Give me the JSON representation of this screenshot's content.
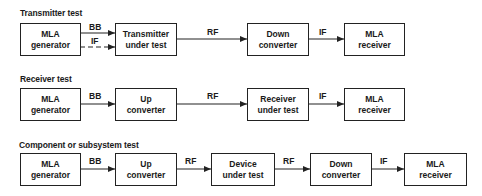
{
  "rows": [
    {
      "title": "Transmitter test",
      "blocks": [
        {
          "line1": "MLA",
          "line2": "generator"
        },
        {
          "line1": "Transmitter",
          "line2": "under test"
        },
        {
          "line1": "Down",
          "line2": "converter"
        },
        {
          "line1": "MLA",
          "line2": "receiver"
        }
      ],
      "signals": [
        "BB",
        "IF",
        "RF",
        "IF"
      ]
    },
    {
      "title": "Receiver test",
      "blocks": [
        {
          "line1": "MLA",
          "line2": "generator"
        },
        {
          "line1": "Up",
          "line2": "converter"
        },
        {
          "line1": "Receiver",
          "line2": "under test"
        },
        {
          "line1": "MLA",
          "line2": "receiver"
        }
      ],
      "signals": [
        "BB",
        "RF",
        "IF"
      ]
    },
    {
      "title": "Component or subsystem test",
      "blocks": [
        {
          "line1": "MLA",
          "line2": "generator"
        },
        {
          "line1": "Up",
          "line2": "converter"
        },
        {
          "line1": "Device",
          "line2": "under test"
        },
        {
          "line1": "Down",
          "line2": "converter"
        },
        {
          "line1": "MLA",
          "line2": "receiver"
        }
      ],
      "signals": [
        "BB",
        "RF",
        "RF",
        "IF"
      ]
    }
  ]
}
